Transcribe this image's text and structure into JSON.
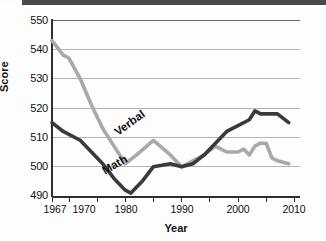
{
  "chart_data": {
    "type": "line",
    "title": "",
    "xlabel": "Year",
    "ylabel": "Score",
    "xlim": [
      1967,
      2011
    ],
    "ylim": [
      490,
      550
    ],
    "ytick_step": 10,
    "yticks": [
      550,
      540,
      530,
      520,
      510,
      500,
      490
    ],
    "xticks": [
      1967,
      1970,
      1975,
      1980,
      1985,
      1990,
      1995,
      2000,
      2005,
      2010
    ],
    "xtick_labels": [
      "1967",
      "1970",
      "",
      "1980",
      "",
      "1990",
      "",
      "2000",
      "",
      "2010"
    ],
    "grid": "horizontal",
    "legend": "inline-labels",
    "series": [
      {
        "name": "Verbal",
        "color": "#a9a9a9",
        "x": [
          1967,
          1969,
          1970,
          1972,
          1974,
          1976,
          1978,
          1980,
          1982,
          1985,
          1988,
          1990,
          1991,
          1994,
          1996,
          1998,
          2000,
          2001,
          2002,
          2003,
          2004,
          2005,
          2006,
          2007,
          2009
        ],
        "y": [
          543,
          538,
          537,
          530,
          521,
          513,
          507,
          501,
          504,
          509,
          504,
          500,
          501,
          504,
          507,
          505,
          505,
          506,
          504,
          507,
          508,
          508,
          503,
          502,
          501
        ]
      },
      {
        "name": "Math",
        "color": "#3a3a3a",
        "x": [
          1967,
          1969,
          1970,
          1972,
          1974,
          1976,
          1978,
          1980,
          1981,
          1983,
          1985,
          1988,
          1990,
          1992,
          1994,
          1996,
          1998,
          2000,
          2002,
          2003,
          2004,
          2005,
          2007,
          2009
        ],
        "y": [
          515,
          512,
          511,
          509,
          505,
          501,
          496,
          492,
          491,
          495,
          500,
          501,
          500,
          501,
          504,
          508,
          512,
          514,
          516,
          519,
          518,
          518,
          518,
          515
        ]
      }
    ],
    "annotations": [
      {
        "text": "Verbal",
        "series": "Verbal"
      },
      {
        "text": "Math",
        "series": "Math"
      }
    ]
  },
  "axes": {
    "y_title": "Score",
    "x_title": "Year",
    "y_ticks": [
      "550",
      "540",
      "530",
      "520",
      "510",
      "500",
      "490"
    ],
    "x_ticks": [
      "1967",
      "1970",
      "1980",
      "1990",
      "2000",
      "2010"
    ]
  },
  "labels": {
    "verbal": "Verbal",
    "math": "Math"
  },
  "colors": {
    "verbal_line": "#a9a9a9",
    "math_line": "#3a3a3a",
    "grid": "#b4b4b4",
    "axis": "#2e2e2e",
    "text": "#111111",
    "background": "#fdfdfd"
  },
  "caption": {
    "cut_off_text": ""
  }
}
